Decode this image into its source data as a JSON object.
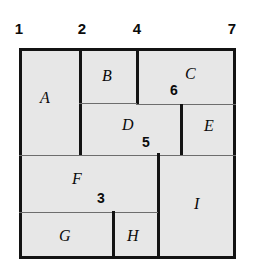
{
  "figure": {
    "background_color": "#ffffff",
    "fill_color": "#e7e7e7",
    "line_color": "#131313",
    "thin_line_color": "#6d6d6d",
    "frame": {
      "x": 19,
      "y": 48,
      "width": 217,
      "height": 211
    }
  },
  "ruler": {
    "orientation": "top",
    "labels": [
      {
        "text": "1",
        "x": 19,
        "y": 21
      },
      {
        "text": "2",
        "x": 82,
        "y": 21
      },
      {
        "text": "4",
        "x": 137,
        "y": 21
      },
      {
        "text": "7",
        "x": 232,
        "y": 21
      }
    ]
  },
  "regions": [
    {
      "label": "A",
      "x": 22,
      "y": 51,
      "width": 58,
      "height": 104,
      "label_x": 40,
      "label_y": 90
    },
    {
      "label": "B",
      "x": 83,
      "y": 51,
      "width": 54,
      "height": 52,
      "label_x": 102,
      "label_y": 68
    },
    {
      "label": "C",
      "x": 141,
      "y": 51,
      "width": 92,
      "height": 54,
      "label_x": 185,
      "label_y": 66
    },
    {
      "label": "D",
      "x": 83,
      "y": 106,
      "width": 96,
      "height": 48,
      "label_x": 122,
      "label_y": 117
    },
    {
      "label": "E",
      "x": 184,
      "y": 106,
      "width": 49,
      "height": 48,
      "label_x": 204,
      "label_y": 118
    },
    {
      "label": "F",
      "x": 22,
      "y": 157,
      "width": 134,
      "height": 55,
      "label_x": 72,
      "label_y": 171
    },
    {
      "label": "G",
      "x": 22,
      "y": 215,
      "width": 89,
      "height": 41,
      "label_x": 59,
      "label_y": 228
    },
    {
      "label": "H",
      "x": 116,
      "y": 215,
      "width": 40,
      "height": 41,
      "label_x": 127,
      "label_y": 228
    },
    {
      "label": "I",
      "x": 162,
      "y": 157,
      "width": 71,
      "height": 99,
      "label_x": 194,
      "label_y": 196
    }
  ],
  "dividers": [
    {
      "name": "a-right-edge",
      "type": "thick-v",
      "x": 79,
      "y": 48,
      "length": 107
    },
    {
      "name": "b-right-edge",
      "type": "thick-v",
      "x": 136,
      "y": 48,
      "length": 57
    },
    {
      "name": "b-bottom-edge",
      "type": "thin-h",
      "x": 79,
      "y": 103,
      "length": 58
    },
    {
      "name": "c-bottom-edge",
      "type": "thin-h",
      "x": 136,
      "y": 104,
      "length": 100
    },
    {
      "name": "d-right-edge",
      "type": "thick-v",
      "x": 180,
      "y": 104,
      "length": 52
    },
    {
      "name": "d-bottom-edge",
      "type": "thin-h",
      "x": 19,
      "y": 155,
      "length": 217
    },
    {
      "name": "f-right-edge",
      "type": "thick-v",
      "x": 157,
      "y": 153,
      "length": 106
    },
    {
      "name": "f-bottom-edge",
      "type": "thin-h",
      "x": 19,
      "y": 212,
      "length": 139
    },
    {
      "name": "g-right-edge",
      "type": "thick-v",
      "x": 112,
      "y": 211,
      "length": 48
    }
  ],
  "annotations": [
    {
      "text": "6",
      "x": 170,
      "y": 83
    },
    {
      "text": "5",
      "x": 142,
      "y": 135
    },
    {
      "text": "3",
      "x": 97,
      "y": 191
    }
  ]
}
